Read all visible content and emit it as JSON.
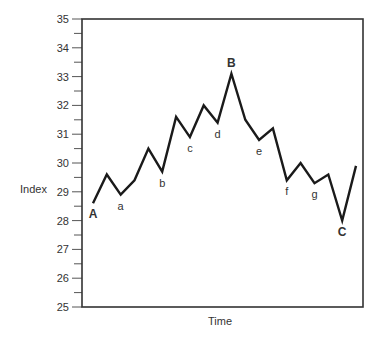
{
  "chart_data": {
    "type": "line",
    "title": "",
    "xlabel": "Time",
    "ylabel": "Index",
    "ylim": [
      25,
      35
    ],
    "yticks": [
      25,
      26,
      27,
      28,
      29,
      30,
      31,
      32,
      33,
      34,
      35
    ],
    "minor_yticks_every": 0.5,
    "grid": false,
    "legend": null,
    "series": [
      {
        "name": "Index",
        "color": "#1a1a1a",
        "x": [
          0,
          1,
          2,
          3,
          4,
          5,
          6,
          7,
          8,
          9,
          10,
          11,
          12,
          13,
          14,
          15,
          16,
          17,
          18,
          19
        ],
        "values": [
          28.6,
          29.6,
          28.9,
          29.4,
          30.5,
          29.7,
          31.6,
          30.9,
          32.0,
          31.4,
          33.1,
          31.5,
          30.8,
          31.2,
          29.4,
          30.0,
          29.3,
          29.6,
          28.0,
          29.9
        ]
      }
    ],
    "annotations": [
      {
        "text": "A",
        "index": 0,
        "position": "below",
        "bold": true
      },
      {
        "text": "a",
        "index": 2,
        "position": "below",
        "bold": false
      },
      {
        "text": "b",
        "index": 5,
        "position": "below",
        "bold": false
      },
      {
        "text": "c",
        "index": 7,
        "position": "below",
        "bold": false
      },
      {
        "text": "d",
        "index": 9,
        "position": "below",
        "bold": false
      },
      {
        "text": "B",
        "index": 10,
        "position": "above",
        "bold": true
      },
      {
        "text": "e",
        "index": 12,
        "position": "below",
        "bold": false
      },
      {
        "text": "f",
        "index": 14,
        "position": "below",
        "bold": false
      },
      {
        "text": "g",
        "index": 16,
        "position": "below",
        "bold": false
      },
      {
        "text": "C",
        "index": 18,
        "position": "below",
        "bold": true
      }
    ]
  },
  "labels": {
    "x_axis": "Time",
    "y_axis": "Index"
  }
}
